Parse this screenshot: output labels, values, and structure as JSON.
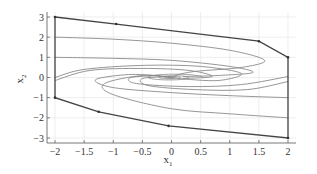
{
  "chart_data": {
    "type": "line",
    "title": "",
    "xlabel": "x",
    "xlabel_sub": "1",
    "ylabel": "x",
    "ylabel_sub": "2",
    "xlim": [
      -2,
      2
    ],
    "ylim": [
      -3,
      3
    ],
    "grid": true,
    "legend": null,
    "x_ticks": [
      -2,
      -1.5,
      -1,
      -0.5,
      0,
      0.5,
      1,
      1.5,
      2
    ],
    "x_tick_labels": [
      "−2",
      "−1.5",
      "−1",
      "−0.5",
      "0",
      "0.5",
      "1",
      "1.5",
      "2"
    ],
    "y_ticks": [
      3,
      2,
      1,
      0,
      -1,
      -2,
      -3
    ],
    "y_tick_labels": [
      "3",
      "2",
      "1",
      "0",
      "−1",
      "−2",
      "−3"
    ],
    "boundary": {
      "description": "Invariant region boundary (dark polygon)",
      "points": [
        [
          -2,
          3
        ],
        [
          -0.95,
          2.65
        ],
        [
          1.5,
          1.8
        ],
        [
          2,
          1.0
        ],
        [
          2,
          -3
        ],
        [
          -0.05,
          -2.4
        ],
        [
          -1.25,
          -1.7
        ],
        [
          -2,
          -1.0
        ],
        [
          -2,
          3
        ]
      ]
    },
    "series": [
      {
        "name": "trajectory-1",
        "points": [
          [
            -2,
            2
          ],
          [
            -1,
            1.9
          ],
          [
            0,
            1.7
          ],
          [
            1,
            1.35
          ],
          [
            1.6,
            0.85
          ],
          [
            1.2,
            0.5
          ],
          [
            0.4,
            0.3
          ],
          [
            0.05,
            0.1
          ]
        ]
      },
      {
        "name": "trajectory-2",
        "points": [
          [
            -2,
            1
          ],
          [
            -1,
            0.95
          ],
          [
            0,
            0.85
          ],
          [
            1,
            0.55
          ],
          [
            1.4,
            0.25
          ],
          [
            0.8,
            0.1
          ],
          [
            0.2,
            0.05
          ]
        ]
      },
      {
        "name": "trajectory-3",
        "points": [
          [
            -2,
            0
          ],
          [
            -1.5,
            0.4
          ],
          [
            -0.5,
            0.6
          ],
          [
            0.5,
            0.55
          ],
          [
            1.2,
            0.2
          ],
          [
            0.8,
            -0.15
          ],
          [
            0.1,
            -0.05
          ]
        ]
      },
      {
        "name": "trajectory-4",
        "points": [
          [
            -2,
            -0.15
          ],
          [
            -1.4,
            0.35
          ],
          [
            -0.5,
            0.45
          ],
          [
            0.3,
            0.35
          ],
          [
            0.7,
            0.05
          ],
          [
            0.2,
            -0.05
          ]
        ]
      },
      {
        "name": "trajectory-5",
        "points": [
          [
            2,
            -1.0
          ],
          [
            1,
            -0.9
          ],
          [
            0,
            -0.75
          ],
          [
            -1,
            -0.5
          ],
          [
            -1.3,
            -0.1
          ],
          [
            -0.7,
            0.15
          ],
          [
            -0.1,
            0.05
          ]
        ]
      },
      {
        "name": "trajectory-6",
        "points": [
          [
            2,
            -2.0
          ],
          [
            1,
            -1.8
          ],
          [
            0,
            -1.55
          ],
          [
            -1,
            -0.85
          ],
          [
            -1.15,
            -0.3
          ],
          [
            -0.5,
            0.1
          ],
          [
            0,
            0
          ]
        ]
      },
      {
        "name": "trajectory-7",
        "points": [
          [
            2,
            0.05
          ],
          [
            1.2,
            -0.35
          ],
          [
            0.3,
            -0.45
          ],
          [
            -0.6,
            -0.3
          ],
          [
            -0.7,
            0.0
          ],
          [
            -0.2,
            0.1
          ]
        ]
      },
      {
        "name": "trajectory-8",
        "points": [
          [
            2,
            -0.2
          ],
          [
            1.3,
            -0.6
          ],
          [
            0.4,
            -0.6
          ],
          [
            -0.4,
            -0.4
          ],
          [
            -0.5,
            -0.05
          ],
          [
            0,
            0.05
          ]
        ]
      }
    ]
  }
}
